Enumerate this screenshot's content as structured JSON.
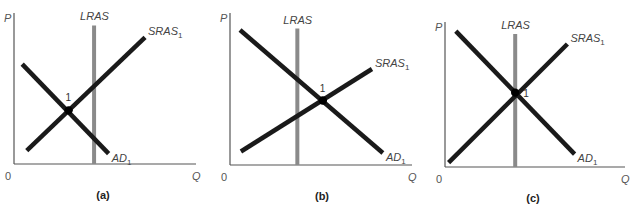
{
  "chart_data": [
    {
      "type": "line",
      "panel_label": "(a)",
      "xlabel": "Q",
      "ylabel": "P",
      "origin_label": "0",
      "xlim": [
        0,
        10
      ],
      "ylim": [
        0,
        10
      ],
      "series": [
        {
          "name": "LRAS",
          "label": "LRAS",
          "kind": "vertical",
          "x": 4.4,
          "y_range": [
            0,
            9.3
          ]
        },
        {
          "name": "SRAS1",
          "label": "SRAS",
          "subscript": "1",
          "points": [
            [
              0.7,
              0.9
            ],
            [
              7.2,
              8.5
            ]
          ]
        },
        {
          "name": "AD1",
          "label": "AD",
          "subscript": "1",
          "points": [
            [
              0.45,
              6.7
            ],
            [
              5.2,
              0.7
            ]
          ]
        }
      ],
      "equilibrium": {
        "label": "1",
        "x": 3.0,
        "y": 3.6
      }
    },
    {
      "type": "line",
      "panel_label": "(b)",
      "xlabel": "Q",
      "ylabel": "P",
      "origin_label": "0",
      "xlim": [
        0,
        10
      ],
      "ylim": [
        0,
        10
      ],
      "series": [
        {
          "name": "LRAS",
          "label": "LRAS",
          "kind": "vertical",
          "x": 3.7,
          "y_range": [
            0,
            9.1
          ]
        },
        {
          "name": "SRAS1",
          "label": "SRAS",
          "subscript": "1",
          "points": [
            [
              0.6,
              0.9
            ],
            [
              7.8,
              6.4
            ]
          ]
        },
        {
          "name": "AD1",
          "label": "AD",
          "subscript": "1",
          "points": [
            [
              0.55,
              9.0
            ],
            [
              8.4,
              0.8
            ]
          ]
        }
      ],
      "equilibrium": {
        "label": "1",
        "x": 5.1,
        "y": 4.3
      }
    },
    {
      "type": "line",
      "panel_label": "(c)",
      "xlabel": "Q",
      "ylabel": "P",
      "origin_label": "0",
      "xlim": [
        0,
        10
      ],
      "ylim": [
        0,
        10
      ],
      "series": [
        {
          "name": "LRAS",
          "label": "LRAS",
          "kind": "vertical",
          "x": 3.9,
          "y_range": [
            0,
            9.3
          ]
        },
        {
          "name": "SRAS1",
          "label": "SRAS",
          "subscript": "1",
          "points": [
            [
              0.2,
              0.3
            ],
            [
              6.8,
              8.6
            ]
          ]
        },
        {
          "name": "AD1",
          "label": "AD",
          "subscript": "1",
          "points": [
            [
              0.6,
              9.5
            ],
            [
              7.2,
              0.9
            ]
          ]
        }
      ],
      "equilibrium": {
        "label": "1",
        "x": 3.9,
        "y": 5.2
      }
    }
  ]
}
